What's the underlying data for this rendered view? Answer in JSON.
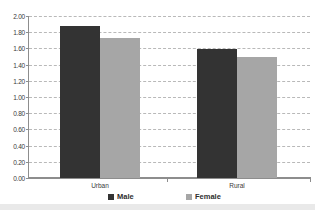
{
  "chart_data": {
    "type": "bar",
    "title": "Sex Ratio in Urban and Rural Areas",
    "xlabel": "",
    "ylabel": "",
    "categories": [
      "Urban",
      "Rural"
    ],
    "series": [
      {
        "name": "Male",
        "color": "#333333",
        "values": [
          1.88,
          1.59
        ]
      },
      {
        "name": "Female",
        "color": "#a6a6a6",
        "values": [
          1.73,
          1.5
        ]
      }
    ],
    "ylim": [
      0.0,
      2.0
    ],
    "ytick_step": 0.2,
    "ytick_labels": [
      "2.00",
      "1.80",
      "1.60",
      "1.40",
      "1.20",
      "1.00",
      "0.80",
      "0.60",
      "0.40",
      "0.20",
      "0.00"
    ],
    "ytick_values": [
      2.0,
      1.8,
      1.6,
      1.4,
      1.2,
      1.0,
      0.8,
      0.6,
      0.4,
      0.2,
      0.0
    ],
    "grid": true,
    "grid_style": "dashed",
    "legend_position": "bottom"
  },
  "legend": {
    "items": [
      {
        "label": "Male",
        "swatch": "male-swatch"
      },
      {
        "label": "Female",
        "swatch": "female-swatch"
      }
    ]
  }
}
